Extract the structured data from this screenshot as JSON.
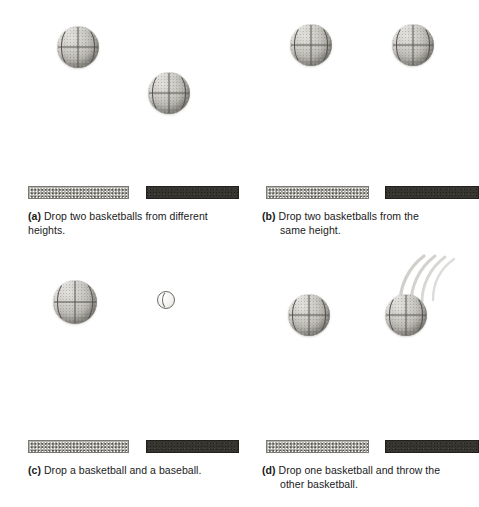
{
  "figure": {
    "background_color": "#ffffff",
    "panel_count": 4
  },
  "panels": [
    {
      "id": "a",
      "label": "(a)",
      "caption_line1": "Drop two basketballs from different heights.",
      "caption_line2": "",
      "balls": [
        {
          "type": "basketball",
          "label": "basketball-left",
          "x": 57,
          "y": 26,
          "size": 42
        },
        {
          "type": "basketball",
          "label": "basketball-right",
          "x": 148,
          "y": 72,
          "size": 42
        }
      ],
      "ground": {
        "light_bar": {
          "label": "cushioned-surface",
          "color": "#b9b7b2"
        },
        "dark_bar": {
          "label": "hard-surface",
          "color": "#37352f"
        }
      },
      "streaks": 0
    },
    {
      "id": "b",
      "label": "(b)",
      "caption_line1": "Drop two basketballs from the",
      "caption_line2": "same  height.",
      "balls": [
        {
          "type": "basketball",
          "label": "basketball-left",
          "x": 50,
          "y": 24,
          "size": 42
        },
        {
          "type": "basketball",
          "label": "basketball-right",
          "x": 152,
          "y": 24,
          "size": 42
        }
      ],
      "ground": {
        "light_bar": {
          "label": "cushioned-surface",
          "color": "#b9b7b2"
        },
        "dark_bar": {
          "label": "hard-surface",
          "color": "#37352f"
        }
      },
      "streaks": 0
    },
    {
      "id": "c",
      "label": "(c)",
      "caption_line1": "Drop a basketball and a baseball.",
      "caption_line2": "",
      "balls": [
        {
          "type": "basketball",
          "label": "basketball",
          "x": 53,
          "y": 26,
          "size": 44
        },
        {
          "type": "baseball",
          "label": "baseball",
          "x": 157,
          "y": 37,
          "size": 18
        }
      ],
      "ground": {
        "light_bar": {
          "label": "cushioned-surface",
          "color": "#b9b7b2"
        },
        "dark_bar": {
          "label": "hard-surface",
          "color": "#37352f"
        }
      },
      "streaks": 0
    },
    {
      "id": "d",
      "label": "(d)",
      "caption_line1": "Drop one basketball and throw the",
      "caption_line2": "other basketball.",
      "balls": [
        {
          "type": "basketball",
          "label": "basketball-dropped",
          "x": 48,
          "y": 40,
          "size": 42
        },
        {
          "type": "basketball",
          "label": "basketball-thrown",
          "x": 145,
          "y": 40,
          "size": 42
        }
      ],
      "ground": {
        "light_bar": {
          "label": "cushioned-surface",
          "color": "#b9b7b2"
        },
        "dark_bar": {
          "label": "hard-surface",
          "color": "#37352f"
        }
      },
      "streaks": 4
    }
  ]
}
